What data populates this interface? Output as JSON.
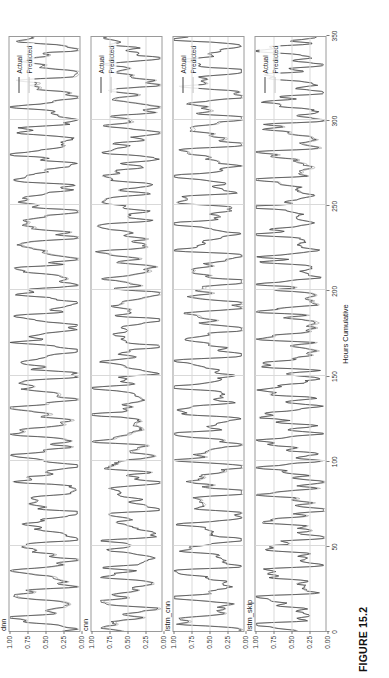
{
  "figure": {
    "caption": "FIGURE 15.2",
    "xlabel": "Hours Cumulative",
    "rotation": "90deg-clockwise-on-page"
  },
  "legend": {
    "position": "top-right-inside-panel",
    "items": [
      {
        "label": "Actual",
        "color": "#444444"
      },
      {
        "label": "Predicted",
        "color": "#b9b9b9"
      }
    ]
  },
  "axes": {
    "xticks": [
      "0",
      "50",
      "100",
      "150",
      "200",
      "250",
      "300",
      "350"
    ],
    "xtick_values": [
      0,
      50,
      100,
      150,
      200,
      250,
      300,
      350
    ],
    "yticks": [
      "0.00",
      "0.25",
      "0.50",
      "0.75",
      "1.00"
    ],
    "ytick_values": [
      0.0,
      0.25,
      0.5,
      0.75,
      1.0
    ],
    "xlim": [
      0,
      350
    ],
    "ylim": [
      0,
      1
    ]
  },
  "panels": [
    {
      "title": "dnn"
    },
    {
      "title": "cnn"
    },
    {
      "title": "lstm_cnn"
    },
    {
      "title": "lstm_skip"
    }
  ],
  "chart_data": {
    "type": "line",
    "title": "FIGURE 15.2",
    "xlabel": "Hours Cumulative",
    "ylabel": "",
    "xlim": [
      0,
      350
    ],
    "ylim": [
      0,
      1
    ],
    "grid": true,
    "legend_position": "top right",
    "panel_layout": "4 rows x 1 column, shared x-axis",
    "panels": [
      {
        "title": "dnn",
        "yticks": [
          0.0,
          0.25,
          0.5,
          0.75,
          1.0
        ],
        "series": [
          {
            "name": "Actual",
            "color": "#444444",
            "x": [
              0,
              5,
              10,
              15,
              20,
              25,
              30,
              35,
              40,
              45,
              50,
              55,
              60,
              65,
              70,
              75,
              80,
              85,
              90,
              95,
              100,
              105,
              110,
              115,
              120,
              125,
              130,
              135,
              140,
              145,
              150,
              155,
              160,
              165,
              170,
              175,
              180,
              185,
              190,
              195,
              200,
              205,
              210,
              215,
              220,
              225,
              230,
              235,
              240,
              245,
              250,
              255,
              260,
              265,
              270,
              275,
              280,
              285,
              290,
              295,
              300,
              305,
              310,
              315,
              320,
              325,
              330,
              335,
              340,
              345,
              350
            ],
            "values": [
              0.1,
              0.3,
              0.55,
              0.42,
              0.3,
              0.48,
              0.62,
              0.45,
              0.26,
              0.4,
              0.66,
              0.52,
              0.33,
              0.46,
              0.7,
              0.55,
              0.34,
              0.44,
              0.6,
              0.46,
              0.28,
              0.42,
              0.64,
              0.5,
              0.3,
              0.45,
              0.68,
              0.53,
              0.32,
              0.44,
              0.62,
              0.48,
              0.29,
              0.41,
              0.66,
              0.54,
              0.35,
              0.47,
              0.7,
              0.56,
              0.33,
              0.43,
              0.61,
              0.47,
              0.27,
              0.4,
              0.65,
              0.51,
              0.31,
              0.45,
              0.69,
              0.55,
              0.34,
              0.46,
              0.63,
              0.49,
              0.28,
              0.42,
              0.67,
              0.53,
              0.32,
              0.44,
              0.71,
              0.57,
              0.36,
              0.48,
              0.64,
              0.5,
              0.3,
              0.41,
              0.58
            ]
          },
          {
            "name": "Predicted",
            "color": "#b9b9b9",
            "x": [
              0,
              5,
              10,
              15,
              20,
              25,
              30,
              35,
              40,
              45,
              50,
              55,
              60,
              65,
              70,
              75,
              80,
              85,
              90,
              95,
              100,
              105,
              110,
              115,
              120,
              125,
              130,
              135,
              140,
              145,
              150,
              155,
              160,
              165,
              170,
              175,
              180,
              185,
              190,
              195,
              200,
              205,
              210,
              215,
              220,
              225,
              230,
              235,
              240,
              245,
              250,
              255,
              260,
              265,
              270,
              275,
              280,
              285,
              290,
              295,
              300,
              305,
              310,
              315,
              320,
              325,
              330,
              335,
              340,
              345,
              350
            ],
            "values": [
              0.14,
              0.33,
              0.52,
              0.44,
              0.33,
              0.5,
              0.59,
              0.47,
              0.3,
              0.43,
              0.63,
              0.54,
              0.36,
              0.48,
              0.67,
              0.57,
              0.37,
              0.46,
              0.58,
              0.48,
              0.31,
              0.44,
              0.61,
              0.52,
              0.33,
              0.47,
              0.65,
              0.55,
              0.35,
              0.46,
              0.6,
              0.5,
              0.32,
              0.43,
              0.63,
              0.56,
              0.38,
              0.49,
              0.67,
              0.58,
              0.36,
              0.45,
              0.59,
              0.49,
              0.3,
              0.42,
              0.62,
              0.53,
              0.34,
              0.47,
              0.66,
              0.57,
              0.37,
              0.48,
              0.61,
              0.51,
              0.31,
              0.44,
              0.64,
              0.55,
              0.35,
              0.46,
              0.68,
              0.59,
              0.39,
              0.5,
              0.62,
              0.52,
              0.33,
              0.43,
              0.56
            ]
          }
        ]
      },
      {
        "title": "cnn",
        "yticks": [
          0.0,
          0.25,
          0.5,
          0.75,
          1.0
        ],
        "series": [
          {
            "name": "Actual",
            "color": "#444444"
          },
          {
            "name": "Predicted",
            "color": "#b9b9b9"
          }
        ]
      },
      {
        "title": "lstm_cnn",
        "yticks": [
          0.0,
          0.25,
          0.5,
          0.75,
          1.0
        ],
        "series": [
          {
            "name": "Actual",
            "color": "#444444"
          },
          {
            "name": "Predicted",
            "color": "#b9b9b9"
          }
        ]
      },
      {
        "title": "lstm_skip",
        "yticks": [
          0.0,
          0.25,
          0.5,
          0.75,
          1.0
        ],
        "series": [
          {
            "name": "Actual",
            "color": "#444444"
          },
          {
            "name": "Predicted",
            "color": "#b9b9b9"
          }
        ]
      }
    ]
  }
}
